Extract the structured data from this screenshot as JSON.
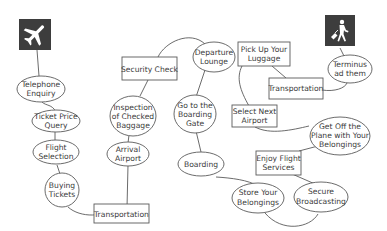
{
  "diagram": {
    "icons": {
      "start": "airplane-icon",
      "end": "traveler-with-luggage-icon"
    },
    "nodes": {
      "telephone_enquiry": {
        "line1": "Telephone",
        "line2": "Enquiry",
        "shape": "ellipse"
      },
      "ticket_price_query": {
        "line1": "Ticket Price",
        "line2": "Query",
        "shape": "ellipse"
      },
      "flight_selection": {
        "line1": "Flight",
        "line2": "Selection",
        "shape": "ellipse"
      },
      "buying_tickets": {
        "line1": "Buying",
        "line2": "Tickets",
        "shape": "ellipse"
      },
      "transportation_1": {
        "line1": "Transportation",
        "shape": "rectangle"
      },
      "arrival_airport": {
        "line1": "Arrival",
        "line2": "Airport",
        "shape": "ellipse"
      },
      "inspection_checked_baggage": {
        "line1": "Inspection",
        "line2": "of Checked",
        "line3": "Baggage",
        "shape": "ellipse"
      },
      "security_check": {
        "line1": "Security Check",
        "shape": "rectangle"
      },
      "departure_lounge": {
        "line1": "Departure",
        "line2": "Lounge",
        "shape": "ellipse"
      },
      "go_to_boarding_gate": {
        "line1": "Go to the",
        "line2": "Boarding",
        "line3": "Gate",
        "shape": "ellipse"
      },
      "boarding": {
        "line1": "Boarding",
        "shape": "ellipse"
      },
      "store_belongings": {
        "line1": "Store Your",
        "line2": "Belongings",
        "shape": "ellipse"
      },
      "secure_broadcasting": {
        "line1": "Secure",
        "line2": "Broadcasting",
        "shape": "ellipse"
      },
      "enjoy_flight_services": {
        "line1": "Enjoy Flight",
        "line2": "Services",
        "shape": "rectangle"
      },
      "get_off_plane": {
        "line1": "Get Off the",
        "line2": "Plane with Your",
        "line3": "Belongings",
        "shape": "ellipse"
      },
      "select_next_airport": {
        "line1": "Select Next",
        "line2": "Airport",
        "shape": "rectangle"
      },
      "pick_up_luggage": {
        "line1": "Pick Up Your",
        "line2": "Luggage",
        "shape": "rectangle"
      },
      "transportation_2": {
        "line1": "Transportation",
        "shape": "rectangle"
      },
      "terminus": {
        "line1": "Terminus",
        "line2": "ad them",
        "shape": "ellipse"
      }
    },
    "colors": {
      "stroke": "#5a5a5a",
      "icon_background": "#3d3d3d",
      "text": "#3a3a3a"
    }
  }
}
